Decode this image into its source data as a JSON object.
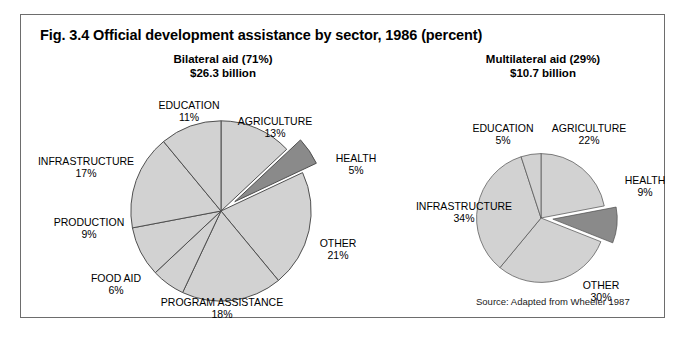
{
  "figure": {
    "title": "Fig. 3.4  Official development assistance by sector, 1986 (percent)",
    "source": "Source: Adapted from Wheeler 1987"
  },
  "colors": {
    "slice_light": "#d2d2d2",
    "slice_highlight": "#8a8a8a",
    "slice_outline": "#4d4d4d",
    "frame": "#6d6d6d",
    "text": "#000000"
  },
  "chart_data": [
    {
      "type": "pie",
      "id": "bilateral",
      "title": "Bilateral aid (71%)",
      "subtitle": "$26.3 billion",
      "share_of_total_pct": 71,
      "total_label": "$26.3 billion",
      "categories": [
        "AGRICULTURE",
        "HEALTH",
        "OTHER",
        "PROGRAM ASSISTANCE",
        "FOOD AID",
        "PRODUCTION",
        "INFRASTRUCTURE",
        "EDUCATION"
      ],
      "values": [
        13,
        5,
        21,
        18,
        6,
        9,
        17,
        11
      ],
      "value_labels": [
        "13%",
        "5%",
        "21%",
        "18%",
        "6%",
        "9%",
        "17%",
        "11%"
      ],
      "exploded": [
        "HEALTH"
      ],
      "units": "percent",
      "legend": "none",
      "start_angle_deg": -90,
      "direction": "clockwise"
    },
    {
      "type": "pie",
      "id": "multilateral",
      "title": "Multilateral aid (29%)",
      "subtitle": "$10.7 billion",
      "share_of_total_pct": 29,
      "total_label": "$10.7 billion",
      "categories": [
        "AGRICULTURE",
        "HEALTH",
        "OTHER",
        "INFRASTRUCTURE",
        "EDUCATION"
      ],
      "values": [
        22,
        9,
        30,
        34,
        5
      ],
      "value_labels": [
        "22%",
        "9%",
        "30%",
        "34%",
        "5%"
      ],
      "exploded": [
        "HEALTH"
      ],
      "units": "percent",
      "legend": "none",
      "start_angle_deg": -90,
      "direction": "clockwise"
    }
  ]
}
